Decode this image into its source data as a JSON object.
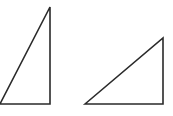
{
  "diagram": {
    "stroke_color": "#2a2a2a",
    "stroke_width": 1.6,
    "shapes": [
      {
        "name": "right-triangle-tall",
        "points": "0,104 50,7 50,104"
      },
      {
        "name": "right-triangle-wide",
        "points": "85,104 163,38 163,104"
      }
    ]
  }
}
